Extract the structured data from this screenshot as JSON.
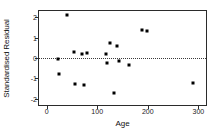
{
  "chart_data": {
    "type": "scatter",
    "title": "",
    "xlabel": "Age",
    "ylabel": "Standardised Residual",
    "xlim": [
      -15,
      315
    ],
    "ylim": [
      -2.3,
      2.3
    ],
    "xticks": [
      0,
      100,
      200,
      300
    ],
    "xticklabels": [
      "0",
      "100",
      "200",
      "300"
    ],
    "yticks": [
      2,
      1,
      0,
      -1,
      -2
    ],
    "yticklabels": [
      "2",
      "1",
      "0",
      "-1",
      "-2"
    ],
    "grid": false,
    "legend": null,
    "reference_lines": [
      {
        "name": "zero-line",
        "orientation": "horizontal",
        "y": 0,
        "style": "dotted"
      }
    ],
    "marker": {
      "shape": "square",
      "color": "#000000",
      "size": 3
    },
    "points": [
      {
        "x": 22,
        "y": -0.07
      },
      {
        "x": 24,
        "y": -0.78
      },
      {
        "x": 40,
        "y": 2.1
      },
      {
        "x": 55,
        "y": 0.28
      },
      {
        "x": 56,
        "y": -1.25
      },
      {
        "x": 70,
        "y": 0.2
      },
      {
        "x": 73,
        "y": -1.3
      },
      {
        "x": 80,
        "y": 0.26
      },
      {
        "x": 118,
        "y": 0.2
      },
      {
        "x": 120,
        "y": -0.23
      },
      {
        "x": 126,
        "y": 0.72
      },
      {
        "x": 134,
        "y": -1.72
      },
      {
        "x": 140,
        "y": 0.58
      },
      {
        "x": 144,
        "y": -0.17
      },
      {
        "x": 163,
        "y": -0.33
      },
      {
        "x": 188,
        "y": 1.38
      },
      {
        "x": 198,
        "y": 1.34
      },
      {
        "x": 290,
        "y": -1.22
      }
    ],
    "n_points": 18
  }
}
